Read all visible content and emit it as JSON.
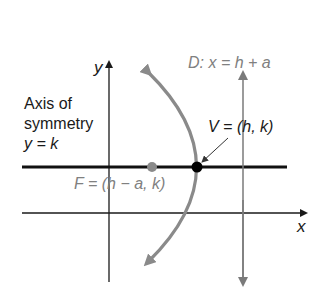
{
  "diagram": {
    "type": "parabola-horizontal-opening-left",
    "axes": {
      "x_label": "x",
      "y_label": "y"
    },
    "axis_of_symmetry": {
      "label_line1": "Axis of",
      "label_line2": "symmetry",
      "equation": "y = k"
    },
    "directrix": {
      "label": "D: x = h + a"
    },
    "vertex": {
      "label": "V = (h, k)"
    },
    "focus": {
      "label": "F = (h − a, k)"
    },
    "colors": {
      "axes": "#1a1a1a",
      "symmetry_line": "#111111",
      "parabola": "#8a8a8a",
      "directrix": "#7a7a7a",
      "focus_point": "#8a8a8a",
      "vertex_point": "#000000",
      "label_gray": "#808080"
    }
  }
}
